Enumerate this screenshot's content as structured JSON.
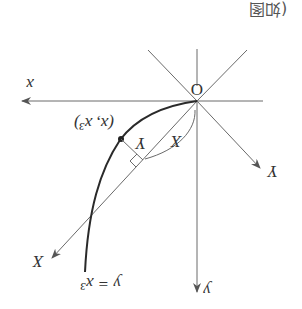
{
  "figure": {
    "caption_fragment": "(如图",
    "orientation": "rotated 180 degrees",
    "origin_label": "O",
    "x_axis_label": "x",
    "y_axis_label": "y",
    "rotated_x_axis_label": "X",
    "rotated_y_axis_label": "Y",
    "point_label": "(x, x³)",
    "curve_label": "y = x³",
    "segment_X_label": "X",
    "segment_Y_label": "Y",
    "colors": {
      "axes": "#6a6a6a",
      "curve": "#2a2a2a",
      "text": "#333333"
    }
  }
}
